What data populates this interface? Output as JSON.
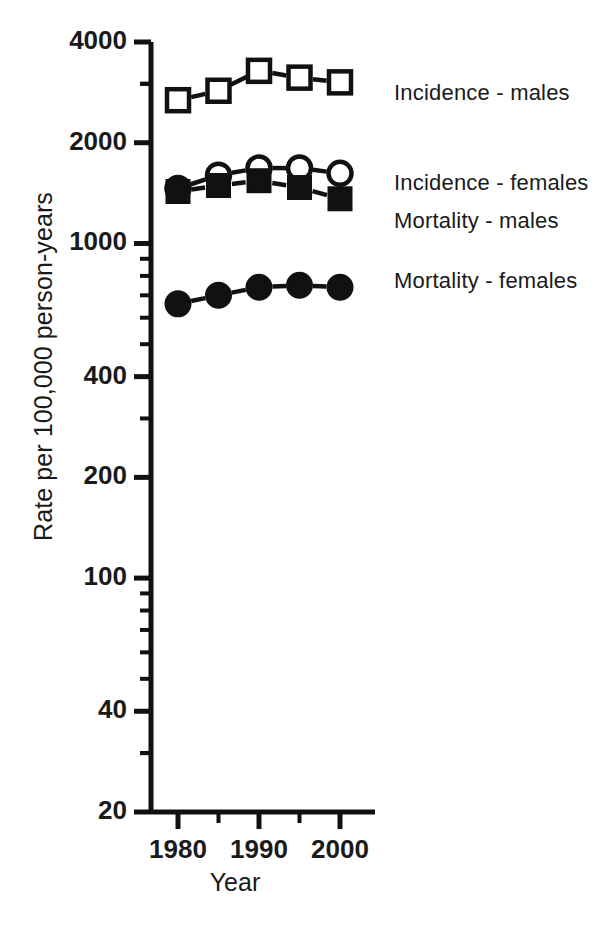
{
  "chart_data": {
    "type": "line",
    "title": "",
    "xlabel": "Year",
    "ylabel": "Rate per 100,000 person-years",
    "yscale": "log",
    "ylim": [
      20,
      4000
    ],
    "xlim": [
      1978,
      2002
    ],
    "grid": false,
    "legend_position": "right-inline",
    "x": [
      1980,
      1985,
      1990,
      1995,
      2000
    ],
    "xticks": [
      1980,
      1990,
      2000
    ],
    "xticklabels": [
      "1980",
      "1990",
      "2000"
    ],
    "xminorticks": [
      1985,
      1995
    ],
    "yticks": [
      20,
      40,
      100,
      200,
      400,
      1000,
      2000,
      4000
    ],
    "yticklabels": [
      "20",
      "40",
      "100",
      "200",
      "400",
      "1000",
      "2000",
      "4000"
    ],
    "series": [
      {
        "name": "Incidence - males",
        "marker": "open-square",
        "values": [
          2680,
          2860,
          3280,
          3130,
          3030
        ]
      },
      {
        "name": "Incidence - females",
        "marker": "open-circle",
        "values": [
          1460,
          1600,
          1680,
          1680,
          1620
        ]
      },
      {
        "name": "Mortality - males",
        "marker": "filled-square",
        "values": [
          1430,
          1490,
          1540,
          1470,
          1360
        ]
      },
      {
        "name": "Mortality - females",
        "marker": "filled-circle",
        "values": [
          660,
          700,
          740,
          750,
          740
        ]
      }
    ]
  },
  "axis": {
    "ylabel": "Rate per 100,000 person-years",
    "xlabel": "Year",
    "ytick_labels": [
      "4000",
      "2000",
      "1000",
      "400",
      "200",
      "100",
      "40",
      "20"
    ],
    "xtick_labels": [
      "1980",
      "1990",
      "2000"
    ]
  },
  "legend": {
    "items": [
      {
        "label": "Incidence - males"
      },
      {
        "label": "Incidence - females"
      },
      {
        "label": "Mortality - males"
      },
      {
        "label": "Mortality - females"
      }
    ]
  }
}
